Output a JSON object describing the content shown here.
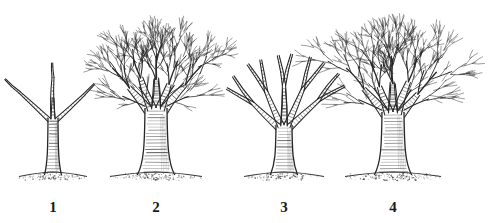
{
  "figure": {
    "background_color": "#ffffff",
    "ink_color": "#262626",
    "soil_color": "#3a3a3a",
    "width": 490,
    "height": 223,
    "style": "black-and-white pen-and-ink line drawing",
    "ground_line_y": 175
  },
  "labels": {
    "one": "1",
    "two": "2",
    "three": "3",
    "four": "4"
  },
  "trees": [
    {
      "label": "1",
      "name": "young-sapling",
      "description": "Young whip with a single slender hatched trunk splitting into three short upright branches",
      "center_x": 53,
      "trunk_top_y": 118,
      "trunk_base_y": 175,
      "trunk_half_width": 5,
      "canopy_top_y": 98,
      "canopy_half_width": 26,
      "branch_count": 3,
      "canopy_density": "sparse",
      "soil_mound_half_width": 34
    },
    {
      "label": "2",
      "name": "mature-unpruned-tree",
      "description": "Mature tree with thick hatched trunk and a dense broad fan-shaped crown of fine bare twigs",
      "center_x": 156,
      "trunk_top_y": 108,
      "trunk_base_y": 175,
      "trunk_half_width": 11,
      "canopy_top_y": 12,
      "canopy_half_width": 72,
      "branch_count": 5,
      "canopy_density": "dense",
      "soil_mound_half_width": 46
    },
    {
      "label": "3",
      "name": "pruned-open-vase-tree",
      "description": "Pruned tree with tall hatched trunk and few heavy scaffold limbs forming an open vase, fine twigs removed",
      "center_x": 284,
      "trunk_top_y": 125,
      "trunk_base_y": 175,
      "trunk_half_width": 8,
      "canopy_top_y": 52,
      "canopy_half_width": 42,
      "branch_count": 5,
      "canopy_density": "sparse",
      "soil_mound_half_width": 40
    },
    {
      "label": "4",
      "name": "large-spreading-tree",
      "description": "Largest tree with stout hatched trunk and a very wide dense spreading crown of bare branches",
      "center_x": 393,
      "trunk_top_y": 112,
      "trunk_base_y": 175,
      "trunk_half_width": 11,
      "canopy_top_y": 10,
      "canopy_half_width": 78,
      "branch_count": 5,
      "canopy_density": "dense",
      "soil_mound_half_width": 48
    }
  ]
}
